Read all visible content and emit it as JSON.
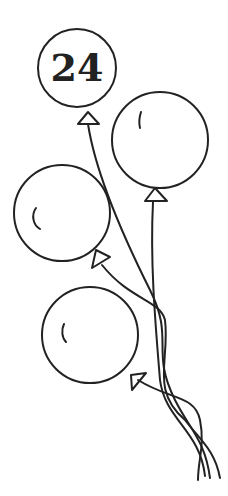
{
  "illustration": {
    "subject": "bunch of four balloons line art",
    "stroke_color": "#222222",
    "background": "#ffffff",
    "balloons": [
      {
        "id": "balloon-1",
        "label": "24",
        "cx": 77,
        "cy": 68,
        "r": 39
      },
      {
        "id": "balloon-2",
        "label": "",
        "cx": 160,
        "cy": 140,
        "r": 48
      },
      {
        "id": "balloon-3",
        "label": "",
        "cx": 62,
        "cy": 213,
        "r": 48
      },
      {
        "id": "balloon-4",
        "label": "",
        "cx": 90,
        "cy": 335,
        "r": 48
      }
    ]
  }
}
